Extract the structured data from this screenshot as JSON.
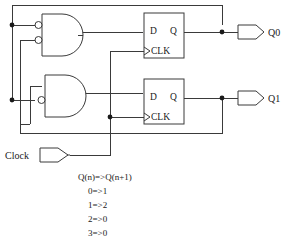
{
  "diagram": {
    "colors": {
      "wire": "#3a3a3a",
      "text": "#1a1a1a",
      "background": "#ffffff",
      "junction": "#1a1a1a"
    }
  },
  "gates": [
    {
      "id": "gate-top",
      "type": "and-gate-with-inverted-inputs",
      "inputs": [
        "inverted",
        "inverted"
      ]
    },
    {
      "id": "gate-bottom",
      "type": "and-gate-with-one-inverted-input",
      "inputs": [
        "normal",
        "inverted"
      ]
    }
  ],
  "flipflops": [
    {
      "id": "flipflop-top",
      "d_label": "D",
      "q_label": "Q",
      "clk_label": "CLK"
    },
    {
      "id": "flipflop-bottom",
      "d_label": "D",
      "q_label": "Q",
      "clk_label": "CLK"
    }
  ],
  "ports": {
    "clock_input": "Clock",
    "output_q0": "Q0",
    "output_q1": "Q1"
  },
  "notes": {
    "heading": "Q(n)=>Q(n+1)",
    "lines": [
      "0=>1",
      "1=>2",
      "2=>0",
      "3=>0"
    ]
  }
}
